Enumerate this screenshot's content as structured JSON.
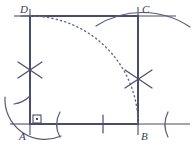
{
  "figure": {
    "type": "geometric-construction",
    "stroke_color": "#4b4b6e",
    "construction_color": "#5a5a78",
    "dotted_color": "#6a6a86",
    "background_color": "#ffffff",
    "canvas": {
      "width": 192,
      "height": 146
    }
  },
  "vertices": [
    {
      "id": "A",
      "label": "A",
      "x": 30,
      "y": 124,
      "label_x": 19,
      "label_y": 138,
      "corner": "bottom-left"
    },
    {
      "id": "B",
      "label": "B",
      "x": 138,
      "y": 124,
      "label_x": 141,
      "label_y": 138,
      "corner": "bottom-right"
    },
    {
      "id": "C",
      "label": "C",
      "x": 138,
      "y": 16,
      "label_x": 142,
      "label_y": 13,
      "corner": "top-right"
    },
    {
      "id": "D",
      "label": "D",
      "x": 30,
      "y": 16,
      "label_x": 20,
      "label_y": 13,
      "corner": "top-left"
    }
  ],
  "square_sides": [
    {
      "name": "side-AB",
      "x1": 30,
      "y1": 124,
      "x2": 138,
      "y2": 124
    },
    {
      "name": "side-BC",
      "x1": 138,
      "y1": 124,
      "x2": 138,
      "y2": 16
    },
    {
      "name": "side-CD",
      "x1": 138,
      "y1": 16,
      "x2": 30,
      "y2": 16
    },
    {
      "name": "side-DA",
      "x1": 30,
      "y1": 16,
      "x2": 30,
      "y2": 124
    }
  ],
  "extended_lines": [
    {
      "name": "baseline-extension-left",
      "x1": 10,
      "y1": 124,
      "x2": 30,
      "y2": 124
    },
    {
      "name": "baseline-extension-right",
      "x1": 138,
      "y1": 124,
      "x2": 190,
      "y2": 124
    },
    {
      "name": "topline-extension-left",
      "x1": 14,
      "y1": 16,
      "x2": 30,
      "y2": 16
    },
    {
      "name": "topline-extension-right",
      "x1": 138,
      "y1": 16,
      "x2": 176,
      "y2": 16
    },
    {
      "name": "left-vertical-extension-top",
      "x1": 30,
      "y1": 10,
      "x2": 30,
      "y2": 16
    },
    {
      "name": "left-vertical-extension-bottom",
      "x1": 30,
      "y1": 124,
      "x2": 30,
      "y2": 134
    },
    {
      "name": "right-vertical-extension-top",
      "x1": 138,
      "y1": 8,
      "x2": 138,
      "y2": 16
    },
    {
      "name": "right-vertical-extension-bottom",
      "x1": 138,
      "y1": 124,
      "x2": 138,
      "y2": 134
    }
  ],
  "right_angle_marker": {
    "name": "right-angle-at-A",
    "x": 32,
    "y": 114,
    "size": 8
  },
  "arc_intersection_crosses": [
    {
      "name": "cross-left",
      "cx": 30,
      "cy": 70,
      "radius": 13
    },
    {
      "name": "cross-right",
      "cx": 138,
      "cy": 79,
      "radius": 14
    }
  ],
  "construction_arcs": [
    {
      "name": "arc-from-A-large",
      "cx": 30,
      "cy": 124,
      "r": 40,
      "start_deg": 186,
      "end_deg": 276
    },
    {
      "name": "arc-from-A-medium",
      "cx": 30,
      "cy": 124,
      "r": 28,
      "start_deg": 200,
      "end_deg": 300
    },
    {
      "name": "arc-near-C-top",
      "cx": 138,
      "cy": 95,
      "r": 74,
      "start_deg": 212,
      "end_deg": 327
    },
    {
      "name": "arc-right-of-B",
      "cx": 138,
      "cy": 124,
      "r": 34,
      "start_deg": 335,
      "end_deg": 25
    }
  ],
  "dotted_arc": {
    "name": "quarter-circle-arc-A",
    "cx": 30,
    "cy": 124,
    "r": 108,
    "start_deg": 270,
    "end_deg": 360,
    "description": "dotted quarter circle centred at A, from side CD down to side BC"
  },
  "tick_marks": [
    {
      "name": "tick-on-AB",
      "x1": 84,
      "y1": 116,
      "x2": 84,
      "y2": 132
    },
    {
      "name": "tick-on-AD-upper",
      "x1": 22,
      "y1": 62,
      "x2": 38,
      "y2": 62
    },
    {
      "name": "tick-on-DA-top",
      "x1": 21,
      "y1": 16,
      "x2": 30,
      "y2": 16
    }
  ],
  "labels_text": {
    "A": "A",
    "B": "B",
    "C": "C",
    "D": "D"
  }
}
